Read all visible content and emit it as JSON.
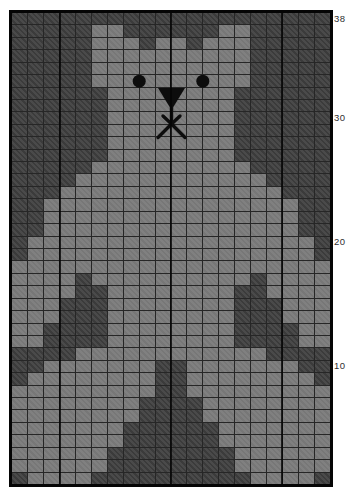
{
  "chart_data": {
    "type": "heatmap",
    "columns": 20,
    "rows": 38,
    "row_axis": {
      "side": "right",
      "tick_labels": [
        "38",
        "30",
        "20",
        "10"
      ],
      "tick_rows": [
        38,
        30,
        20,
        10
      ],
      "numbering": "bottom-up"
    },
    "legend": [
      {
        "value": ".",
        "name": "background-stitch",
        "color": "#424242"
      },
      {
        "value": "B",
        "name": "bear-stitch",
        "color": "#7c7c7c"
      }
    ],
    "pattern_rows_top_to_bottom": [
      "....................",
      ".....BB......BB.....",
      ".....BBB.BB.BBB.....",
      ".....BBBBBBBBBB.....",
      ".....BBBBBBBBBB.....",
      ".....BBBBBBBBBB.....",
      "......BBBBBBBB......",
      "......BBBBBBBB......",
      "......BBBBBBBB......",
      "......BBBBBBBB......",
      "......BBBBBBBB......",
      "......BBBBBBBB......",
      ".....BBBBBBBBBB.....",
      "....BBBBBBBBBBBB....",
      "...BBBBBBBBBBBBBB...",
      "..BBBBBBBBBBBBBBBB..",
      "..BBBBBBBBBBBBBBBB..",
      "..BBBBBBBBBBBBBBBB..",
      ".BBBBBBBBBBBBBBBBBB.",
      ".BBBBBBBBBBBBBBBBBB.",
      "BBBBBBBBBBBBBBBBBBBB",
      "BBBB.BBBBBBBBBB.BBBB",
      "BBBB..BBBBBBBB..BBBB",
      "BBB...BBBBBBBB...BBB",
      "BBB...BBBBBBBB...BBB",
      "BB....BBBBBBBB....BB",
      "BB....BBBBBBBB....BB",
      "....BBBBBBBBBBBB....",
      "..BBBBBBB..BBBBBBB..",
      ".BBBBBBBB..BBBBBBBB.",
      "BBBBBBBBB..BBBBBBBBB",
      "BBBBBBBB....BBBBBBBB",
      "BBBBBBBB....BBBBBBBB",
      "BBBBBBB......BBBBBBB",
      "BBBBBBB......BBBBBBB",
      "BBBBBB........BBBBBB",
      "BBBBBB........BBBBBB",
      ".BBBB..........BBBB.",
      "_comment_rows_note"
    ],
    "repeat_line_columns_after": [
      3,
      10,
      17
    ],
    "face_features": {
      "left_eye": {
        "cx": 127.2,
        "cy": 68.2,
        "r": 6.5,
        "color": "#0d0d0d"
      },
      "right_eye": {
        "cx": 190.8,
        "cy": 68.2,
        "r": 6.5,
        "color": "#0d0d0d"
      },
      "nose_triangle": {
        "points": "146,75 173,75 159.5,97",
        "color": "#0d0d0d"
      },
      "mouth_strokes": [
        {
          "x1": 159.5,
          "y1": 94,
          "x2": 159.5,
          "y2": 111
        },
        {
          "x1": 159.5,
          "y1": 111,
          "x2": 146,
          "y2": 124.5
        },
        {
          "x1": 159.5,
          "y1": 111,
          "x2": 173,
          "y2": 124.5
        },
        {
          "x1": 159.5,
          "y1": 111,
          "x2": 151,
          "y2": 103
        },
        {
          "x1": 159.5,
          "y1": 111,
          "x2": 168,
          "y2": 103
        }
      ],
      "stroke_width": 3.4
    },
    "layout": {
      "chart_left": 12,
      "chart_top": 13,
      "chart_width": 318,
      "chart_height": 471,
      "label_x": 334
    },
    "colors": {
      "page_background": "#ffffff",
      "border": "#050505",
      "gridline": "#262626",
      "background_stitch": "#424242",
      "bear_stitch": "#7c7c7c",
      "label_text": "#2f2f2f"
    }
  }
}
